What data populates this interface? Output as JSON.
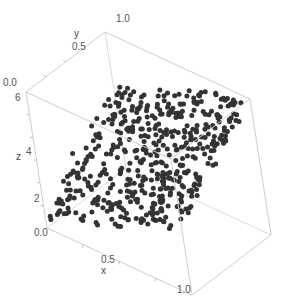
{
  "chart_data": {
    "type": "scatter",
    "subtype": "3d_point_plot",
    "title": "",
    "xlabel": "x",
    "ylabel": "y",
    "zlabel": "z",
    "xlim": [
      0.0,
      1.0
    ],
    "ylim": [
      0.0,
      1.0
    ],
    "zlim": [
      0.0,
      6.0
    ],
    "x_ticks": [
      "0.0",
      "0.5",
      "1.0"
    ],
    "y_ticks": [
      "0.0",
      "0.5",
      "1.0"
    ],
    "z_ticks": [
      "2",
      "4",
      "6"
    ],
    "grid": false,
    "legend": null,
    "box": true,
    "point_color": "#333333",
    "box_color": "#d0d0d0",
    "model": {
      "intercept": 0.5,
      "x_coef": 2.5,
      "y_coef": 3.0,
      "noise": 0.25
    },
    "n_points": 500,
    "seed": 12345
  },
  "labels": {
    "x_axis": "x",
    "y_axis": "y",
    "z_axis": "z",
    "x_tick_0": "0.0",
    "x_tick_05": "0.5",
    "x_tick_1": "1.0",
    "y_tick_0": "0.0",
    "y_tick_05": "0.5",
    "y_tick_1": "1.0",
    "z_tick_2": "2",
    "z_tick_4": "4",
    "z_tick_6": "6"
  }
}
